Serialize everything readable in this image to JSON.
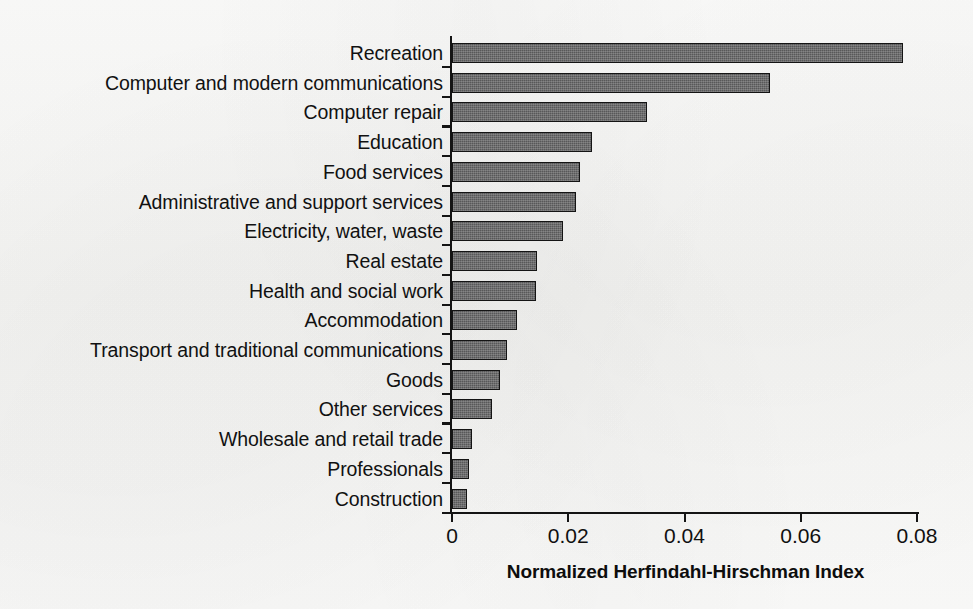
{
  "chart_data": {
    "type": "bar",
    "orientation": "horizontal",
    "title": "",
    "xlabel": "Normalized Herfindahl-Hirschman Index",
    "ylabel": "",
    "xlim": [
      0,
      0.08
    ],
    "xticks": [
      0,
      0.02,
      0.04,
      0.06,
      0.08
    ],
    "xtick_labels": [
      "0",
      "0.02",
      "0.04",
      "0.06",
      "0.08"
    ],
    "grid": false,
    "legend": null,
    "bar_color": "#585859",
    "bar_edge_color": "#141414",
    "categories": [
      "Recreation",
      "Computer and modern communications",
      "Computer repair",
      "Education",
      "Food services",
      "Administrative and support services",
      "Electricity, water, waste",
      "Real estate",
      "Health and social work",
      "Accommodation",
      "Transport and traditional communications",
      "Goods",
      "Other services",
      "Wholesale and retail trade",
      "Professionals",
      "Construction"
    ],
    "values": [
      0.0776,
      0.0547,
      0.0335,
      0.0241,
      0.022,
      0.0214,
      0.0191,
      0.0146,
      0.0145,
      0.0112,
      0.0094,
      0.0083,
      0.0068,
      0.0034,
      0.003,
      0.0025
    ]
  }
}
